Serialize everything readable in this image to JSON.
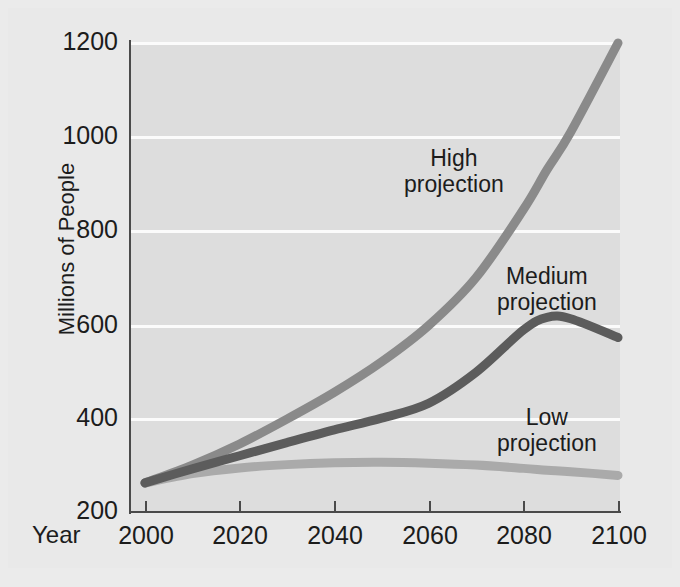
{
  "chart_data": {
    "type": "line",
    "title": "",
    "subtitle": "",
    "xlabel": "Year",
    "ylabel": "Millions of People",
    "xlim": [
      2000,
      2100
    ],
    "ylim": [
      200,
      1200
    ],
    "xticks": [
      "2000",
      "2020",
      "2040",
      "2060",
      "2080",
      "2100"
    ],
    "yticks": [
      "200",
      "400",
      "600",
      "800",
      "1000",
      "1200"
    ],
    "grid": "horizontal",
    "legend": "inline-annotations",
    "x": [
      2000,
      2010,
      2020,
      2030,
      2040,
      2050,
      2060,
      2070,
      2080,
      2085,
      2090,
      2100
    ],
    "series": [
      {
        "name": "High projection",
        "color": "#8a8a8a",
        "values": [
          262,
          300,
          345,
          398,
          455,
          520,
          598,
          700,
          845,
          930,
          1010,
          1200
        ]
      },
      {
        "name": "Medium projection",
        "color": "#5c5c5c",
        "values": [
          262,
          292,
          320,
          348,
          375,
          400,
          432,
          498,
          588,
          615,
          612,
          572
        ]
      },
      {
        "name": "Low projection",
        "color": "#aaaaaa",
        "values": [
          262,
          282,
          294,
          301,
          305,
          306,
          304,
          300,
          293,
          289,
          286,
          278
        ]
      }
    ],
    "annotations": [
      {
        "id": "high",
        "line1": "High",
        "line2": "projection"
      },
      {
        "id": "medium",
        "line1": "Medium",
        "line2": "projection"
      },
      {
        "id": "low",
        "line1": "Low",
        "line2": "projection"
      }
    ]
  },
  "colors": {
    "background": "#e9e9e9",
    "plot_background": "#dddddd",
    "gridline": "#fbfbfb",
    "axis": "#4a4a4a",
    "text": "#1c1c1c",
    "high": "#8a8a8a",
    "medium": "#5c5c5c",
    "low": "#aaaaaa"
  }
}
